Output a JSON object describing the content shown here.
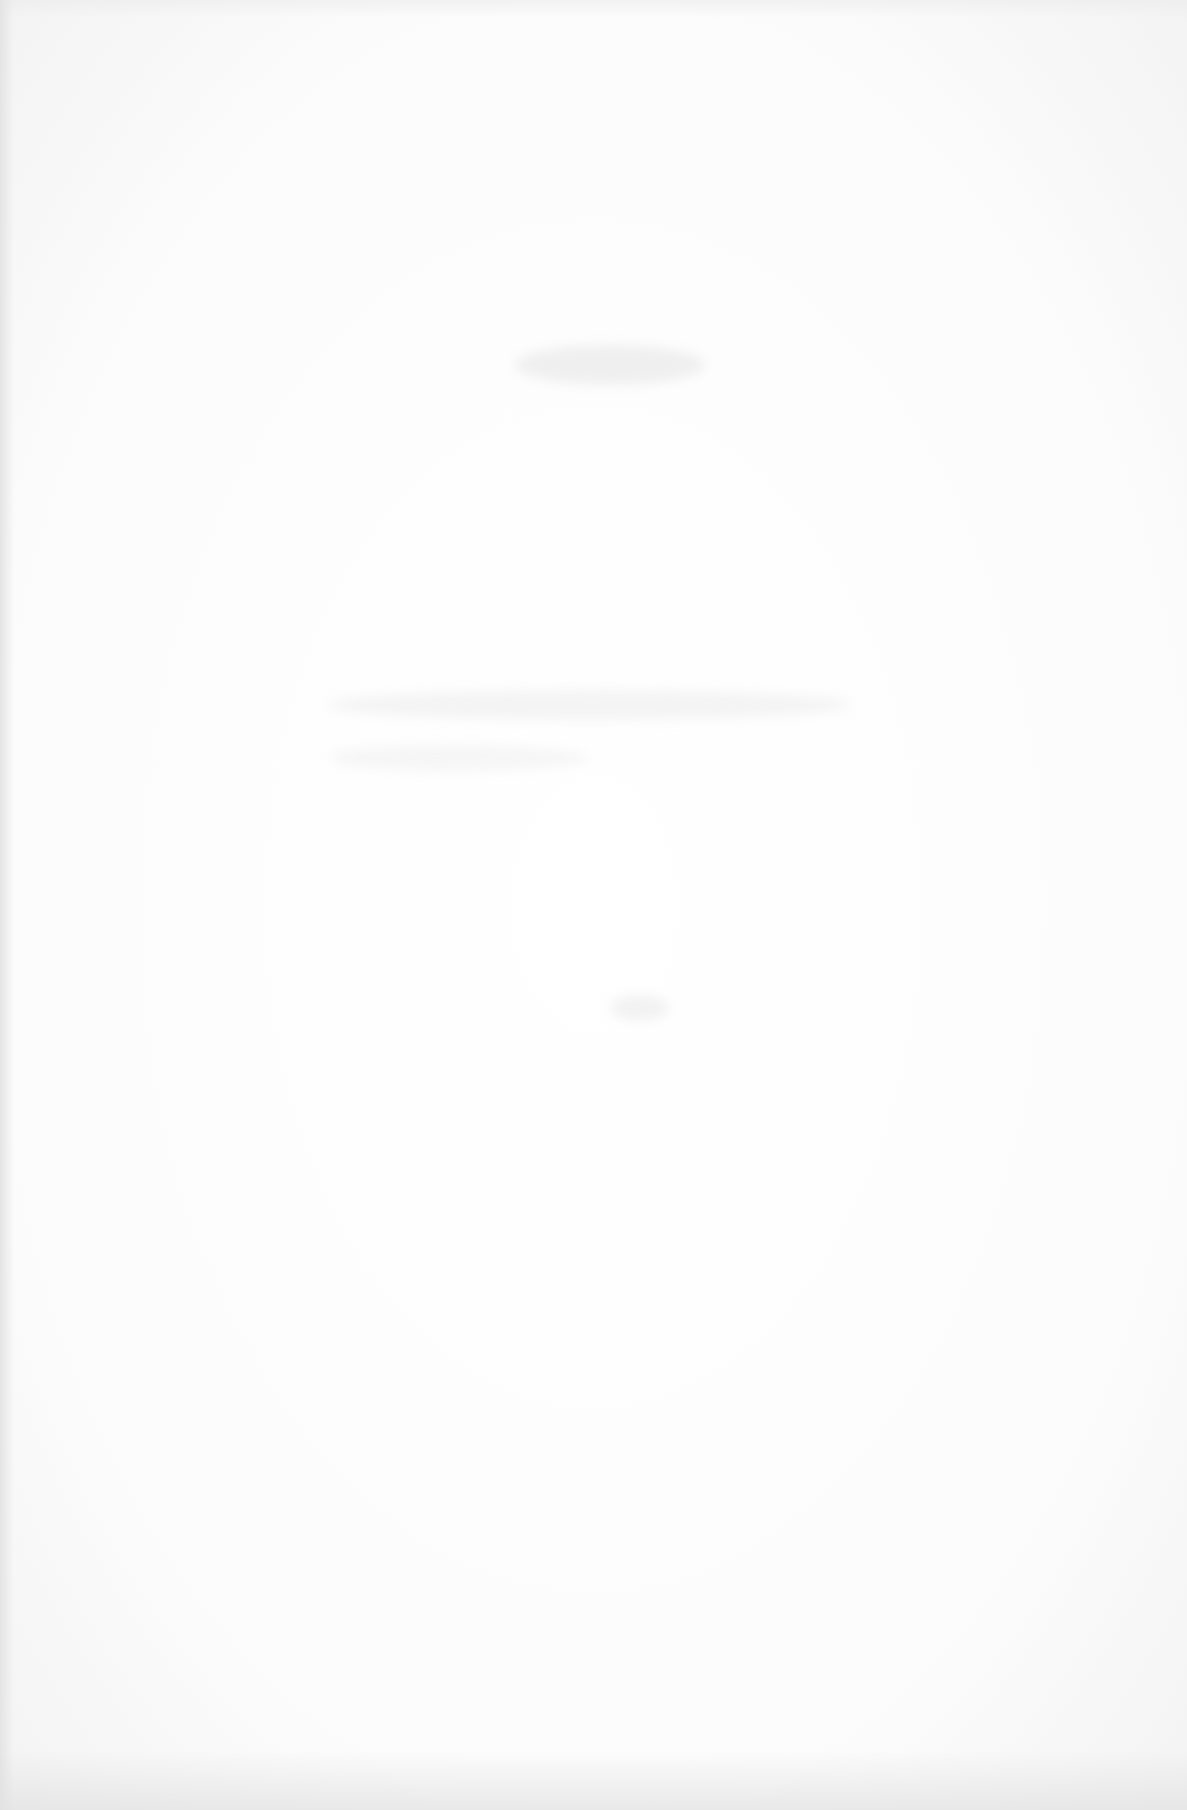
{
  "document": {
    "type": "blank scanned page",
    "visible_text": [],
    "notes": "No legible content; only faint show-through marks from the reverse side."
  },
  "colors": {
    "paper": "#fdfdfd",
    "edge_shadow": "#e4e4e4",
    "bleed_marks": "#d6d6d6"
  }
}
